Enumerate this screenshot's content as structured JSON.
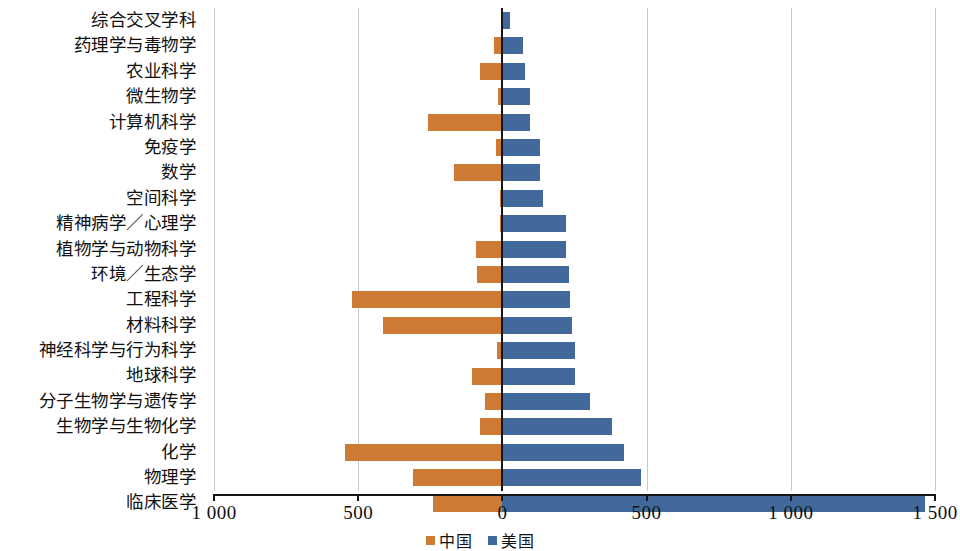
{
  "chart_data": {
    "type": "bar",
    "orientation": "horizontal",
    "style": "diverging-bidirectional",
    "title": "",
    "subtitle": "",
    "xlabel": "",
    "ylabel": "",
    "xlim": [
      -1000,
      1500
    ],
    "xticks": [
      -1000,
      -500,
      0,
      500,
      1000,
      1500
    ],
    "xtick_labels": [
      "1 000",
      "500",
      "0",
      "500",
      "1 000",
      "1 500"
    ],
    "grid": true,
    "grid_axis": "x",
    "legend_position": "bottom-center",
    "categories": [
      "综合交叉学科",
      "药理学与毒物学",
      "农业科学",
      "微生物学",
      "计算机科学",
      "免疫学",
      "数学",
      "空间科学",
      "精神病学／心理学",
      "植物学与动物科学",
      "环境／生态学",
      "工程科学",
      "材料科学",
      "神经科学与行为科学",
      "地球科学",
      "分子生物学与遗传学",
      "生物学与生物化学",
      "化学",
      "物理学",
      "临床医学"
    ],
    "series": [
      {
        "name": "中国",
        "color": "#cd7b34",
        "direction": "left",
        "values": [
          5,
          30,
          77,
          14,
          257,
          21,
          169,
          7,
          10,
          92,
          88,
          520,
          415,
          18,
          105,
          60,
          77,
          545,
          310,
          240
        ]
      },
      {
        "name": "美国",
        "color": "#41699b",
        "direction": "right",
        "values": [
          28,
          72,
          77,
          95,
          95,
          130,
          130,
          140,
          220,
          220,
          230,
          233,
          240,
          253,
          253,
          305,
          380,
          422,
          482,
          1465
        ]
      }
    ],
    "legend": [
      {
        "label": "中国",
        "color": "#cd7b34"
      },
      {
        "label": "美国",
        "color": "#41699b"
      }
    ]
  }
}
